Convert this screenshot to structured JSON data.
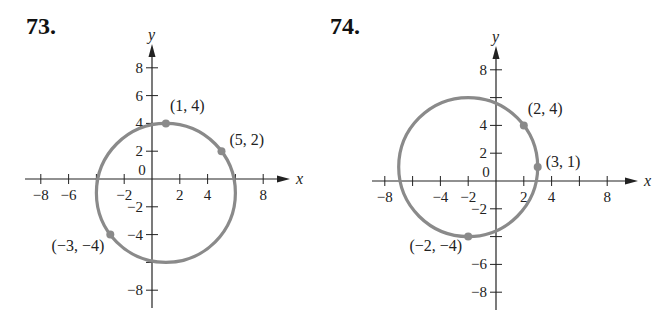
{
  "problems": [
    {
      "number": "73."
    },
    {
      "number": "74."
    }
  ],
  "chart_data": [
    {
      "type": "scatter",
      "title": "73.",
      "xlabel": "x",
      "ylabel": "y",
      "xlim": [
        -9,
        10
      ],
      "ylim": [
        -9,
        10
      ],
      "xticks": [
        -8,
        -6,
        -4,
        -2,
        2,
        4,
        6,
        8
      ],
      "xtick_labels": [
        "-8",
        "-6",
        "",
        "-2",
        "2",
        "4",
        "",
        "8"
      ],
      "yticks": [
        8,
        6,
        4,
        2,
        -2,
        -4,
        -6,
        -8
      ],
      "ytick_labels": [
        "8",
        "6",
        "4",
        "2",
        "-2",
        "-4",
        "",
        "-8"
      ],
      "origin_label": "0",
      "grid": false,
      "circle": {
        "center": [
          1,
          -1
        ],
        "radius": 5
      },
      "points": [
        {
          "x": 1,
          "y": 4,
          "label": "(1, 4)"
        },
        {
          "x": 5,
          "y": 2,
          "label": "(5, 2)"
        },
        {
          "x": -3,
          "y": -4,
          "label": "(−3, −4)"
        }
      ]
    },
    {
      "type": "scatter",
      "title": "74.",
      "xlabel": "x",
      "ylabel": "y",
      "xlim": [
        -9,
        10
      ],
      "ylim": [
        -9,
        10
      ],
      "xticks": [
        -8,
        -6,
        -4,
        -2,
        2,
        4,
        6,
        8
      ],
      "xtick_labels": [
        "-8",
        "",
        "-4",
        "-2",
        "2",
        "4",
        "",
        "8"
      ],
      "yticks": [
        8,
        6,
        4,
        2,
        -2,
        -4,
        -6,
        -8
      ],
      "ytick_labels": [
        "8",
        "",
        "4",
        "2",
        "-2",
        "",
        "-6",
        "-8"
      ],
      "origin_label": "0",
      "grid": false,
      "circle": {
        "center": [
          -2,
          1
        ],
        "radius": 5
      },
      "points": [
        {
          "x": 2,
          "y": 4,
          "label": "(2, 4)"
        },
        {
          "x": 3,
          "y": 1,
          "label": "(3, 1)"
        },
        {
          "x": -2,
          "y": -4,
          "label": "(−2, −4)"
        }
      ]
    }
  ],
  "colors": {
    "curve": "#8a8a8a",
    "axis": "#222222"
  }
}
